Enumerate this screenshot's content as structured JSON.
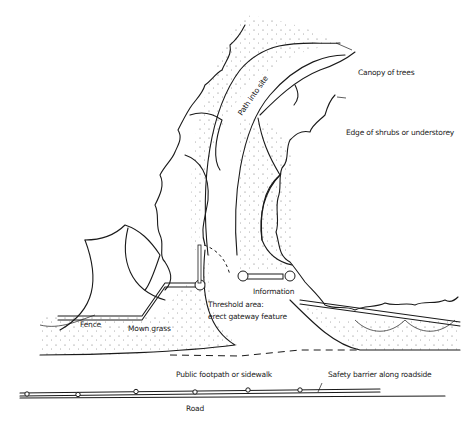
{
  "diagram": {
    "type": "site entrance sketch plan",
    "labels": {
      "path": "Path into site",
      "canopy": "Canopy of trees",
      "shrubs": "Edge of shrubs or understorey",
      "fence": "Fence",
      "grass": "Mown grass",
      "threshold_line1": "Threshold area:",
      "threshold_line2": "erect gateway feature",
      "information": "Information",
      "footpath": "Public footpath or sidewalk",
      "barrier": "Safety barrier along roadside",
      "road": "Road"
    },
    "colors": {
      "ink": "#1a1a1a",
      "background": "#ffffff"
    }
  }
}
